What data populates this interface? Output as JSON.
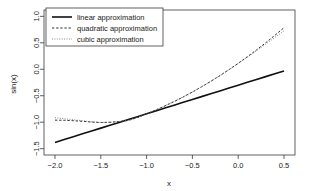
{
  "chart_data": {
    "type": "line",
    "title": "",
    "xlabel": "x",
    "ylabel": "sin(x)",
    "xlim": [
      -2.12,
      0.62
    ],
    "ylim": [
      -1.62,
      1.12
    ],
    "xticks": [
      -2.0,
      -1.5,
      -1.0,
      -0.5,
      0.0,
      0.5
    ],
    "xticklabels": [
      "-2.0",
      "-1.5",
      "-1.0",
      "-0.5",
      "0.0",
      "0.5"
    ],
    "yticks": [
      -1.5,
      -1.0,
      -0.5,
      0.0,
      0.5,
      1.0
    ],
    "yticklabels": [
      "-1.5",
      "-1.0",
      "-0.5",
      "0.0",
      "0.5",
      "1.0"
    ],
    "grid": false,
    "legend_position": "top-left",
    "legend_entries": [
      {
        "label": "linear approximation",
        "style": "solid",
        "color": "#101010",
        "width": 1.6
      },
      {
        "label": "quadratic approximation",
        "style": "dashed",
        "color": "#1a1a1a",
        "width": 0.9
      },
      {
        "label": "cubic approximation",
        "style": "dotted",
        "color": "#6e6e6e",
        "width": 0.9
      }
    ],
    "series": [
      {
        "name": "linear approximation",
        "style": "solid",
        "color": "#101010",
        "width": 1.6,
        "x": [
          -2.0,
          -1.9,
          -1.8,
          -1.7,
          -1.6,
          -1.5,
          -1.4,
          -1.3,
          -1.2,
          -1.1,
          -1.0,
          -0.9,
          -0.8,
          -0.7,
          -0.6,
          -0.5,
          -0.4,
          -0.3,
          -0.2,
          -0.1,
          0.0,
          0.1,
          0.2,
          0.3,
          0.4,
          0.5
        ],
        "y": [
          -1.382,
          -1.328,
          -1.274,
          -1.22,
          -1.166,
          -1.112,
          -1.058,
          -1.004,
          -0.95,
          -0.896,
          -0.841,
          -0.787,
          -0.733,
          -0.679,
          -0.625,
          -0.571,
          -0.517,
          -0.463,
          -0.409,
          -0.355,
          -0.301,
          -0.247,
          -0.193,
          -0.139,
          -0.085,
          -0.031
        ]
      },
      {
        "name": "quadratic approximation",
        "style": "dashed",
        "color": "#1a1a1a",
        "width": 0.9,
        "x": [
          -2.0,
          -1.9,
          -1.8,
          -1.7,
          -1.6,
          -1.5,
          -1.4,
          -1.3,
          -1.2,
          -1.1,
          -1.0,
          -0.9,
          -0.8,
          -0.7,
          -0.6,
          -0.5,
          -0.4,
          -0.3,
          -0.2,
          -0.1,
          0.0,
          0.1,
          0.2,
          0.3,
          0.4,
          0.5
        ],
        "y": [
          -0.961,
          -0.964,
          -0.972,
          -0.983,
          -0.998,
          -1.007,
          -1.001,
          -0.988,
          -0.968,
          -0.913,
          -0.841,
          -0.77,
          -0.693,
          -0.611,
          -0.523,
          -0.43,
          -0.332,
          -0.228,
          -0.12,
          -0.006,
          0.113,
          0.237,
          0.366,
          0.501,
          0.641,
          0.786
        ]
      },
      {
        "name": "cubic approximation",
        "style": "dotted",
        "color": "#6e6e6e",
        "width": 0.9,
        "x": [
          -2.0,
          -1.9,
          -1.8,
          -1.7,
          -1.6,
          -1.5,
          -1.4,
          -1.3,
          -1.2,
          -1.1,
          -1.0,
          -0.9,
          -0.8,
          -0.7,
          -0.6,
          -0.5,
          -0.4,
          -0.3,
          -0.2,
          -0.1,
          0.0,
          0.1,
          0.2,
          0.3,
          0.4,
          0.5
        ],
        "y": [
          -0.916,
          -0.934,
          -0.953,
          -0.972,
          -0.991,
          -1.003,
          -1.001,
          -0.987,
          -0.962,
          -0.909,
          -0.841,
          -0.768,
          -0.69,
          -0.607,
          -0.52,
          -0.428,
          -0.331,
          -0.229,
          -0.122,
          -0.01,
          0.107,
          0.227,
          0.349,
          0.474,
          0.6,
          0.727
        ]
      }
    ]
  }
}
